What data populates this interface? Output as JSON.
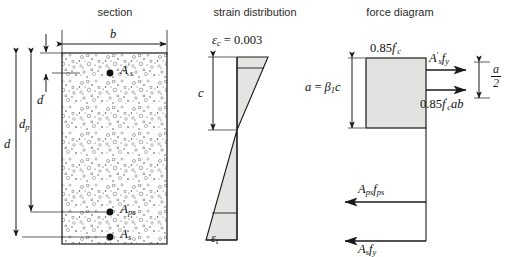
{
  "figure": {
    "panels": [
      {
        "key": "section",
        "title": "section"
      },
      {
        "key": "strain",
        "title": "strain distribution"
      },
      {
        "key": "force",
        "title": "force diagram"
      }
    ]
  },
  "colors": {
    "line": "#1a1a1a",
    "fill_strain": "#e4e4e2",
    "fill_block": "#e2e2e0",
    "concrete_bg": "#ffffff",
    "text": "#1a1a1a",
    "title_text": "#2b2b2b"
  },
  "section": {
    "title": "section",
    "width_label": "b",
    "dimensions": [
      {
        "name": "d",
        "label": "d"
      },
      {
        "name": "dp",
        "label": "dp"
      },
      {
        "name": "dprime",
        "label": "d'"
      }
    ],
    "bars": [
      {
        "name": "compression-steel",
        "label": "A's",
        "position": "top"
      },
      {
        "name": "prestress-steel",
        "label": "Aps",
        "position": "lower"
      },
      {
        "name": "tension-steel",
        "label": "As",
        "position": "bottom"
      }
    ]
  },
  "strain": {
    "title": "strain distribution",
    "top_label": "εc = 0.003",
    "top_label_symbol": "ε",
    "top_label_sub": "c",
    "top_label_value": "0.003",
    "depth_label": "c",
    "bottom_label_symbol": "ε",
    "bottom_label_sub": "t"
  },
  "force": {
    "title": "force diagram",
    "stress_label": "0.85f'c",
    "depth_label": "a = β1c",
    "beta_symbol": "β",
    "beta_sub": "1",
    "half_depth_num": "a",
    "half_depth_den": "2",
    "forces": [
      {
        "name": "compression-steel-force",
        "label": "A'sfy",
        "direction": "right"
      },
      {
        "name": "concrete-block-force",
        "label": "0.85f'cab",
        "direction": "right"
      },
      {
        "name": "prestress-force",
        "label": "Apsfps",
        "direction": "left"
      },
      {
        "name": "tension-steel-force",
        "label": "Asfy",
        "direction": "left"
      }
    ]
  }
}
